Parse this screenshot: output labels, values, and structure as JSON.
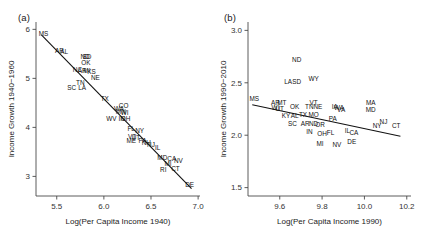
{
  "figure": {
    "background_color": "#ffffff",
    "line_color": "#111111",
    "axis_color": "#4a4a4a"
  },
  "panels": [
    {
      "tag": "(a)",
      "xlabel": "Log(Per Capita Income 1940)",
      "ylabel": "Income Growth 1940−1960"
    },
    {
      "tag": "(b)",
      "xlabel": "Log(Per Capita Income 1990)",
      "ylabel": "Income Growth 1990−2010"
    }
  ],
  "chart_data": [
    {
      "type": "scatter",
      "panel": "(a)",
      "title": "",
      "xlabel": "Log(Per Capita Income 1940)",
      "ylabel": "Income Growth 1940−1960",
      "xlim": [
        5.28,
        7.02
      ],
      "ylim": [
        2.6,
        6.15
      ],
      "xticks": [
        5.5,
        6.0,
        6.5,
        7.0
      ],
      "xtick_labels": [
        "5.5",
        "6.0",
        "6.5",
        "7.0"
      ],
      "yticks": [
        3,
        4,
        5,
        6
      ],
      "ytick_labels": [
        "3",
        "4",
        "5",
        "6"
      ],
      "grid": false,
      "legend": "none",
      "marker_style": "state-abbreviation-text",
      "fit_line": {
        "x": [
          5.34,
          6.93
        ],
        "y": [
          5.88,
          2.75
        ]
      },
      "labels": [
        "MS",
        "AR",
        "AL",
        "ND",
        "SD",
        "OK",
        "NC",
        "AR2",
        "MI",
        "KS",
        "NE",
        "TN",
        "SC",
        "LA",
        "TX",
        "CO",
        "WV",
        "WA",
        "MN",
        "WI",
        "IN",
        "FL",
        "NY",
        "VT",
        "UT",
        "ME",
        "OH",
        "PA",
        "NH",
        "IL",
        "MD",
        "CA",
        "NV",
        "MI2",
        "NJ",
        "RI",
        "CT",
        "DE"
      ],
      "points": [
        {
          "label": "MS",
          "x": 5.36,
          "y": 5.86
        },
        {
          "label": "AR",
          "x": 5.53,
          "y": 5.52
        },
        {
          "label": "AL",
          "x": 5.58,
          "y": 5.5
        },
        {
          "label": "ND",
          "x": 5.8,
          "y": 5.4
        },
        {
          "label": "SD",
          "x": 5.82,
          "y": 5.39
        },
        {
          "label": "OK",
          "x": 5.81,
          "y": 5.27
        },
        {
          "label": "NC",
          "x": 5.72,
          "y": 5.12
        },
        {
          "label": "AR2",
          "x": 5.77,
          "y": 5.1
        },
        {
          "label": "MI",
          "x": 5.82,
          "y": 5.1
        },
        {
          "label": "KS",
          "x": 5.87,
          "y": 5.09
        },
        {
          "label": "NE",
          "x": 5.91,
          "y": 4.97
        },
        {
          "label": "TN",
          "x": 5.75,
          "y": 4.87
        },
        {
          "label": "SC",
          "x": 5.66,
          "y": 4.76
        },
        {
          "label": "LA",
          "x": 5.77,
          "y": 4.76
        },
        {
          "label": "TX",
          "x": 6.01,
          "y": 4.53
        },
        {
          "label": "CO",
          "x": 6.21,
          "y": 4.4
        },
        {
          "label": "WA",
          "x": 6.16,
          "y": 4.33
        },
        {
          "label": "MN",
          "x": 6.18,
          "y": 4.28
        },
        {
          "label": "WI",
          "x": 6.22,
          "y": 4.25
        },
        {
          "label": "WV",
          "x": 6.08,
          "y": 4.13
        },
        {
          "label": "IN",
          "x": 6.19,
          "y": 4.12
        },
        {
          "label": "OH",
          "x": 6.23,
          "y": 4.12
        },
        {
          "label": "FL",
          "x": 6.29,
          "y": 3.92
        },
        {
          "label": "NY",
          "x": 6.38,
          "y": 3.88
        },
        {
          "label": "VT",
          "x": 6.3,
          "y": 3.76
        },
        {
          "label": "UT",
          "x": 6.34,
          "y": 3.74
        },
        {
          "label": "ME",
          "x": 6.29,
          "y": 3.68
        },
        {
          "label": "PA",
          "x": 6.41,
          "y": 3.68
        },
        {
          "label": "NH",
          "x": 6.45,
          "y": 3.64
        },
        {
          "label": "NJ",
          "x": 6.5,
          "y": 3.6
        },
        {
          "label": "IL",
          "x": 6.57,
          "y": 3.54
        },
        {
          "label": "MD",
          "x": 6.62,
          "y": 3.33
        },
        {
          "label": "CA",
          "x": 6.72,
          "y": 3.31
        },
        {
          "label": "NV",
          "x": 6.79,
          "y": 3.28
        },
        {
          "label": "MI2",
          "x": 6.68,
          "y": 3.22
        },
        {
          "label": "RI",
          "x": 6.63,
          "y": 3.09
        },
        {
          "label": "CT",
          "x": 6.76,
          "y": 3.1
        },
        {
          "label": "DE",
          "x": 6.91,
          "y": 2.78
        }
      ]
    },
    {
      "type": "scatter",
      "panel": "(b)",
      "title": "",
      "xlabel": "Log(Per Capita Income 1990)",
      "ylabel": "Income Growth 1990−2010",
      "xlim": [
        9.45,
        10.22
      ],
      "ylim": [
        1.42,
        3.08
      ],
      "xticks": [
        9.6,
        9.8,
        10.0,
        10.2
      ],
      "xtick_labels": [
        "9.6",
        "9.8",
        "10.0",
        "10.2"
      ],
      "yticks": [
        1.5,
        2.0,
        2.5,
        3.0
      ],
      "ytick_labels": [
        "1.5",
        "2.0",
        "2.5",
        "3.0"
      ],
      "grid": false,
      "legend": "none",
      "marker_style": "state-abbreviation-text",
      "fit_line": {
        "x": [
          9.47,
          10.17
        ],
        "y": [
          2.29,
          1.99
        ]
      },
      "labels": [
        "MS",
        "ND",
        "LA",
        "SD",
        "WY",
        "AR",
        "MT",
        "WI",
        "UT",
        "OK",
        "VT",
        "TN",
        "NE",
        "OH",
        "IA",
        "WA",
        "KY",
        "TX",
        "MO",
        "AL",
        "SC",
        "AR2",
        "ND2",
        "OR",
        "IN",
        "OH2",
        "FL",
        "MI",
        "NV",
        "DE",
        "CA",
        "IL",
        "PA",
        "VA",
        "NH",
        "MN",
        "MA",
        "MD",
        "NY",
        "NJ",
        "CT"
      ],
      "points": [
        {
          "label": "MS",
          "x": 9.48,
          "y": 2.33
        },
        {
          "label": "ND",
          "x": 9.68,
          "y": 2.7
        },
        {
          "label": "LA",
          "x": 9.64,
          "y": 2.49
        },
        {
          "label": "SD",
          "x": 9.68,
          "y": 2.49
        },
        {
          "label": "WY",
          "x": 9.76,
          "y": 2.52
        },
        {
          "label": "AR",
          "x": 9.58,
          "y": 2.29
        },
        {
          "label": "MT",
          "x": 9.61,
          "y": 2.29
        },
        {
          "label": "WI",
          "x": 9.58,
          "y": 2.24
        },
        {
          "label": "UT",
          "x": 9.6,
          "y": 2.23
        },
        {
          "label": "OK",
          "x": 9.67,
          "y": 2.25
        },
        {
          "label": "VT",
          "x": 9.76,
          "y": 2.29
        },
        {
          "label": "TN",
          "x": 9.74,
          "y": 2.25
        },
        {
          "label": "NE",
          "x": 9.78,
          "y": 2.25
        },
        {
          "label": "IA",
          "x": 9.86,
          "y": 2.25
        },
        {
          "label": "WA",
          "x": 9.88,
          "y": 2.24
        },
        {
          "label": "KY",
          "x": 9.63,
          "y": 2.16
        },
        {
          "label": "TX",
          "x": 9.71,
          "y": 2.17
        },
        {
          "label": "MO",
          "x": 9.76,
          "y": 2.17
        },
        {
          "label": "AL",
          "x": 9.67,
          "y": 2.16
        },
        {
          "label": "SC",
          "x": 9.66,
          "y": 2.09
        },
        {
          "label": "AR2",
          "x": 9.72,
          "y": 2.09
        },
        {
          "label": "ND2",
          "x": 9.76,
          "y": 2.09
        },
        {
          "label": "OR",
          "x": 9.79,
          "y": 2.08
        },
        {
          "label": "PA",
          "x": 9.85,
          "y": 2.14
        },
        {
          "label": "VA",
          "x": 9.89,
          "y": 2.22
        },
        {
          "label": "IN",
          "x": 9.74,
          "y": 2.01
        },
        {
          "label": "OH2",
          "x": 9.8,
          "y": 1.99
        },
        {
          "label": "FL",
          "x": 9.84,
          "y": 2.0
        },
        {
          "label": "IL",
          "x": 9.92,
          "y": 2.02
        },
        {
          "label": "CA",
          "x": 9.95,
          "y": 2.0
        },
        {
          "label": "MI",
          "x": 9.79,
          "y": 1.9
        },
        {
          "label": "NV",
          "x": 9.87,
          "y": 1.89
        },
        {
          "label": "DE",
          "x": 9.94,
          "y": 1.92
        },
        {
          "label": "MA",
          "x": 10.03,
          "y": 2.29
        },
        {
          "label": "MD",
          "x": 10.03,
          "y": 2.22
        },
        {
          "label": "NY",
          "x": 10.06,
          "y": 2.07
        },
        {
          "label": "NJ",
          "x": 10.09,
          "y": 2.11
        },
        {
          "label": "CT",
          "x": 10.15,
          "y": 2.07
        }
      ]
    }
  ]
}
